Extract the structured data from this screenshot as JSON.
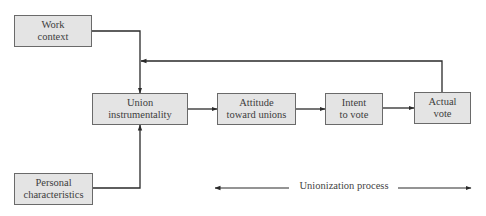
{
  "diagram": {
    "title": "",
    "nodes": {
      "work_context": {
        "lines": [
          "Work",
          "context"
        ]
      },
      "union_instrumentality": {
        "lines": [
          "Union",
          "instrumentality"
        ]
      },
      "attitude_toward_unions": {
        "lines": [
          "Attitude",
          "toward unions"
        ]
      },
      "intent_to_vote": {
        "lines": [
          "Intent",
          "to vote"
        ]
      },
      "actual_vote": {
        "lines": [
          "Actual",
          "vote"
        ]
      },
      "personal_characteristics": {
        "lines": [
          "Personal",
          "characteristics"
        ]
      }
    },
    "edges": [
      {
        "from": "work_context",
        "to": "union_instrumentality"
      },
      {
        "from": "personal_characteristics",
        "to": "union_instrumentality"
      },
      {
        "from": "union_instrumentality",
        "to": "attitude_toward_unions"
      },
      {
        "from": "attitude_toward_unions",
        "to": "intent_to_vote"
      },
      {
        "from": "intent_to_vote",
        "to": "actual_vote"
      },
      {
        "from": "actual_vote",
        "to": "union_instrumentality",
        "type": "feedback"
      }
    ],
    "process_axis": {
      "label": "Unionization process",
      "direction": "bidirectional"
    },
    "colors": {
      "box_fill": "#e4e4e4",
      "box_border": "#6a6a6a",
      "line": "#2a2a2a"
    }
  }
}
